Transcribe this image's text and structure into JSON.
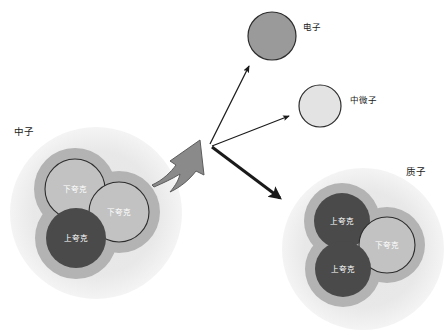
{
  "diagram": {
    "background_color": "#ffffff",
    "colors": {
      "nucleon_halo": "#eaeaea",
      "quark_shell": "#b3b3b3",
      "quark_dark": "#4a4a4a",
      "quark_light": "#c2c2c2",
      "quark_light_stroke": "#2d2d2d",
      "electron_fill": "#9a9a9a",
      "electron_stroke": "#2d2d2d",
      "neutrino_fill": "#e3e3e3",
      "neutrino_stroke": "#2d2d2d",
      "thick_gray_arrow": "#8a8a8a",
      "thick_gray_arrow_stroke": "#5c5c5c",
      "arrow_black": "#1a1a1a",
      "label_text": "#1a1a1a",
      "quark_text": "#ffffff"
    },
    "neutron": {
      "label": "中子",
      "label_x": 14,
      "label_y": 135,
      "cx": 96,
      "cy": 213,
      "r": 86,
      "quarks": [
        {
          "name": "quark-down-1",
          "label": "下夸克",
          "cx": 75,
          "cy": 189,
          "r": 30,
          "type": "light"
        },
        {
          "name": "quark-down-2",
          "label": "下夸克",
          "cx": 119,
          "cy": 212,
          "r": 30,
          "type": "light"
        },
        {
          "name": "quark-up-1",
          "label": "上夸克",
          "cx": 76,
          "cy": 238,
          "r": 30,
          "type": "dark"
        }
      ]
    },
    "proton": {
      "label": "质子",
      "label_x": 406,
      "label_y": 175,
      "cx": 363,
      "cy": 249,
      "r": 81,
      "quarks": [
        {
          "name": "quark-up-1",
          "label": "上夸克",
          "cx": 342,
          "cy": 221,
          "r": 28,
          "type": "dark"
        },
        {
          "name": "quark-down-1",
          "label": "下夸克",
          "cx": 387,
          "cy": 245,
          "r": 28,
          "type": "light"
        },
        {
          "name": "quark-up-2",
          "label": "上夸克",
          "cx": 343,
          "cy": 269,
          "r": 28,
          "type": "dark"
        }
      ]
    },
    "electron": {
      "label": "电子",
      "cx": 272,
      "cy": 36,
      "r": 24,
      "label_x": 303,
      "label_y": 30
    },
    "neutrino": {
      "label": "中微子",
      "cx": 320,
      "cy": 106,
      "r": 21,
      "label_x": 350,
      "label_y": 103
    },
    "vertex": {
      "x": 210,
      "y": 144
    },
    "arrows": [
      {
        "name": "arrow-to-electron",
        "kind": "thin",
        "x1": 210,
        "y1": 144,
        "x2": 249,
        "y2": 66
      },
      {
        "name": "arrow-to-neutrino",
        "kind": "thin",
        "x1": 212,
        "y1": 146,
        "x2": 289,
        "y2": 116
      },
      {
        "name": "arrow-to-proton",
        "kind": "thick",
        "x1": 212,
        "y1": 147,
        "x2": 282,
        "y2": 200
      }
    ],
    "decay_arrow": {
      "name": "neutron-decay-arrow",
      "description": "thick tapered gray arrow from neutron to interaction vertex"
    }
  }
}
